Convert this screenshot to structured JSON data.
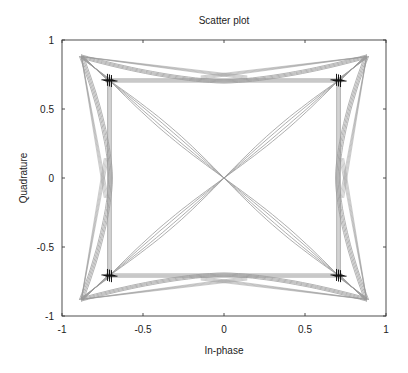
{
  "chart_data": {
    "type": "scatter",
    "title": "Scatter plot",
    "xlabel": "In-phase",
    "ylabel": "Quadrature",
    "xlim": [
      -1,
      1
    ],
    "ylim": [
      -1,
      1
    ],
    "xticks": [
      -1,
      -0.5,
      0,
      0.5,
      1
    ],
    "yticks": [
      -1,
      -0.5,
      0,
      0.5,
      1
    ],
    "xtick_labels": [
      "-1",
      "-0.5",
      "0",
      "0.5",
      "1"
    ],
    "ytick_labels": [
      "-1",
      "-0.5",
      "0",
      "0.5",
      "1"
    ],
    "grid": false,
    "legend": null,
    "series": [
      {
        "name": "Signal trajectory",
        "style": "line",
        "color": "#9a9a9a",
        "description": "Pulse-shaped QPSK transitions between constellation points, overshoot peaks near ±0.88",
        "peak_amplitude": 0.88,
        "edge_mid_amplitude": 0.7
      },
      {
        "name": "Symbol samples",
        "style": "marker",
        "marker": "+",
        "color": "#111111",
        "points": [
          {
            "x": 0.707,
            "y": 0.707
          },
          {
            "x": -0.707,
            "y": 0.707
          },
          {
            "x": -0.707,
            "y": -0.707
          },
          {
            "x": 0.707,
            "y": -0.707
          }
        ]
      }
    ]
  },
  "layout": {
    "plot_box": {
      "left": 62,
      "top": 40,
      "right": 386,
      "bottom": 316
    }
  }
}
